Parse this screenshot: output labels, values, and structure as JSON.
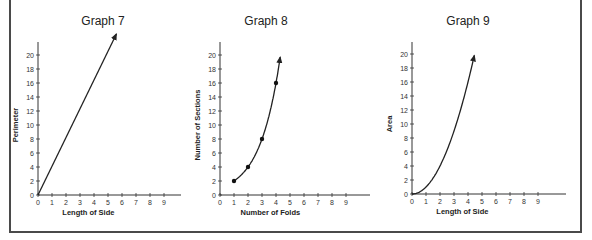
{
  "chart_data": [
    {
      "type": "line",
      "title": "Graph 7",
      "xlabel": "Length of Side",
      "ylabel": "Perimeter",
      "x_ticks": [
        "0",
        "1",
        "2",
        "3",
        "4",
        "5",
        "6",
        "7",
        "8",
        "9"
      ],
      "y_ticks": [
        "0",
        "2",
        "4",
        "6",
        "8",
        "10",
        "12",
        "14",
        "16",
        "18",
        "20"
      ],
      "xlim": [
        0,
        10.5
      ],
      "ylim": [
        0,
        22
      ],
      "relation": "linear",
      "series": [
        {
          "name": "Perimeter",
          "x": [
            0,
            5.6
          ],
          "y": [
            0,
            23
          ],
          "markers": false,
          "arrow_end": true
        }
      ]
    },
    {
      "type": "line",
      "title": "Graph 8",
      "xlabel": "Number of Folds",
      "ylabel": "Number of Sections",
      "x_ticks": [
        "0",
        "1",
        "2",
        "3",
        "4",
        "5",
        "6",
        "7",
        "8",
        "9"
      ],
      "y_ticks": [
        "0",
        "2",
        "4",
        "6",
        "8",
        "10",
        "12",
        "14",
        "16",
        "18",
        "20"
      ],
      "xlim": [
        0,
        10.5
      ],
      "ylim": [
        0,
        22
      ],
      "relation": "exponential",
      "series": [
        {
          "name": "Sections",
          "x": [
            1,
            2,
            3,
            4
          ],
          "y": [
            2,
            4,
            8,
            16
          ],
          "markers": true,
          "arrow_end": true,
          "curve_to": [
            4.3,
            22
          ]
        }
      ]
    },
    {
      "type": "line",
      "title": "Graph 9",
      "xlabel": "Length of Side",
      "ylabel": "Area",
      "x_ticks": [
        "0",
        "1",
        "2",
        "3",
        "4",
        "5",
        "6",
        "7",
        "8",
        "9"
      ],
      "y_ticks": [
        "0",
        "2",
        "4",
        "6",
        "8",
        "10",
        "12",
        "14",
        "16",
        "18",
        "20"
      ],
      "xlim": [
        0,
        10.5
      ],
      "ylim": [
        0,
        22
      ],
      "relation": "quadratic",
      "series": [
        {
          "name": "Area",
          "x": [
            0,
            1,
            2,
            3,
            4,
            4.45
          ],
          "y": [
            0,
            1,
            4,
            9,
            16,
            19.8
          ],
          "markers": false,
          "arrow_end": true
        }
      ]
    }
  ]
}
